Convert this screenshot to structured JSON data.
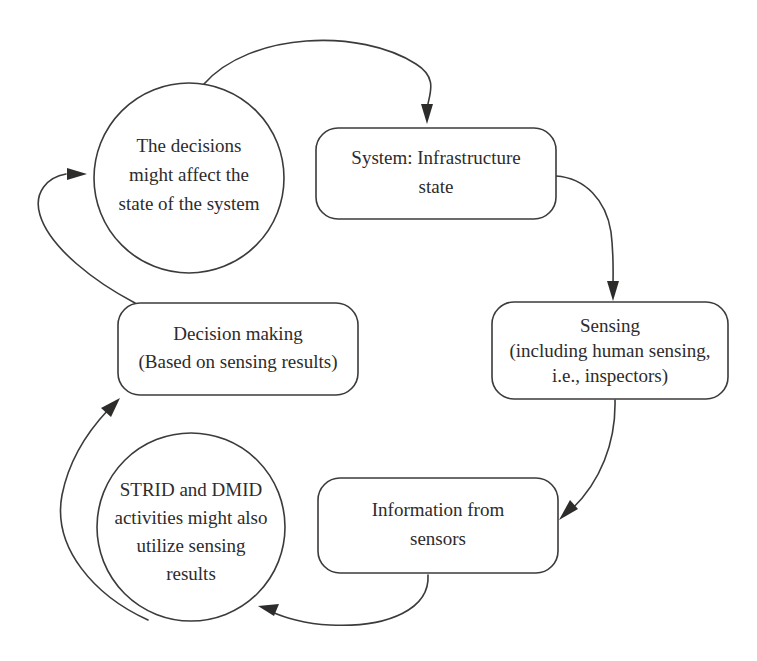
{
  "diagram": {
    "type": "cyclic-flow-diagram",
    "background_color": "#ffffff",
    "stroke_color": "#3c3a3a",
    "text_color": "#2e2b2b",
    "nodes": [
      {
        "id": "decisions-affect-state",
        "shape": "circle",
        "lines": [
          "The decisions",
          "might affect the",
          "state of the system"
        ]
      },
      {
        "id": "system-infrastructure-state",
        "shape": "rounded-rect",
        "lines": [
          "System: Infrastructure",
          "state"
        ]
      },
      {
        "id": "sensing",
        "shape": "rounded-rect",
        "lines": [
          "Sensing",
          "(including human sensing,",
          "i.e., inspectors)"
        ]
      },
      {
        "id": "information-from-sensors",
        "shape": "rounded-rect",
        "lines": [
          "Information from",
          "sensors"
        ]
      },
      {
        "id": "strid-dmid-activities",
        "shape": "circle",
        "lines": [
          "STRID and DMID",
          "activities might also",
          "utilize sensing",
          "results"
        ]
      },
      {
        "id": "decision-making",
        "shape": "rounded-rect",
        "lines": [
          "Decision making",
          "(Based on sensing results)"
        ]
      }
    ],
    "edges": [
      {
        "id": "edge-decisions-to-system",
        "from": "decisions-affect-state",
        "to": "system-infrastructure-state"
      },
      {
        "id": "edge-system-to-sensing",
        "from": "system-infrastructure-state",
        "to": "sensing"
      },
      {
        "id": "edge-sensing-to-information",
        "from": "sensing",
        "to": "information-from-sensors"
      },
      {
        "id": "edge-information-to-strid",
        "from": "information-from-sensors",
        "to": "strid-dmid-activities"
      },
      {
        "id": "edge-strid-to-decision-making",
        "from": "strid-dmid-activities",
        "to": "decision-making"
      },
      {
        "id": "edge-decision-making-to-decisions",
        "from": "decision-making",
        "to": "decisions-affect-state"
      }
    ]
  }
}
